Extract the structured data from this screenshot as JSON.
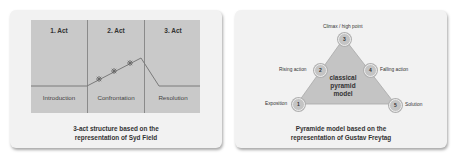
{
  "left_diagram": {
    "acts": [
      {
        "title": "1. Act",
        "phase": "Introduction"
      },
      {
        "title": "2. Act",
        "phase": "Confrontation"
      },
      {
        "title": "3. Act",
        "phase": "Resolution"
      }
    ],
    "markers": [
      "*",
      "*",
      "*"
    ],
    "caption_line1": "3-act structure based on the",
    "caption_line2": "representation of Syd Field"
  },
  "right_diagram": {
    "center_line1": "classical",
    "center_line2": "pyramid",
    "center_line3": "model",
    "nodes": [
      {
        "number": "1",
        "label": "Exposition"
      },
      {
        "number": "2",
        "label": "Rising action"
      },
      {
        "number": "3",
        "label": "Climax / high point"
      },
      {
        "number": "4",
        "label": "Falling action"
      },
      {
        "number": "5",
        "label": "Solution"
      }
    ],
    "caption_line1": "Pyramide model based on the",
    "caption_line2": "representation of Gustav Freytag"
  },
  "colors": {
    "card_bg": "#f2f2f2",
    "panel_bg": "#c9c9c9",
    "line": "#7a7a7a",
    "triangle": "#c4c4c4"
  }
}
